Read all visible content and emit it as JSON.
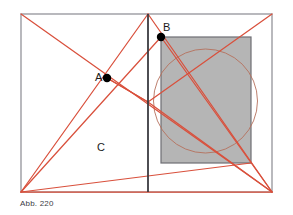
{
  "figure": {
    "caption": "Abb. 220",
    "colors": {
      "construction_line": "#d9503c",
      "frame_stroke": "#8a8a92",
      "axis_stroke": "#3a3a40",
      "shaded_rect_fill": "#b5b5b5",
      "shaded_rect_stroke": "#6e6e74",
      "circle_stroke": "#b5705c",
      "point_fill": "#000000",
      "label_color": "#1a1a1a",
      "caption_color": "#3c3c46",
      "background": "#ffffff"
    },
    "labels": [
      {
        "id": "A",
        "text": "A",
        "x": 95,
        "y": 81
      },
      {
        "id": "B",
        "text": "B",
        "x": 163,
        "y": 31
      },
      {
        "id": "C",
        "text": "C",
        "x": 97,
        "y": 151
      }
    ],
    "points": [
      {
        "id": "A",
        "cx": 107,
        "cy": 78,
        "r": 4.2
      },
      {
        "id": "B",
        "cx": 161,
        "cy": 37,
        "r": 4.2
      }
    ],
    "outer_frame": {
      "x": 21,
      "y": 14,
      "width": 251,
      "height": 178
    },
    "vertical_axis": {
      "x": 148,
      "y1": 14,
      "y2": 192
    },
    "shaded_rect": {
      "x": 161,
      "y": 37,
      "width": 90,
      "height": 126
    },
    "inscribed_circle": {
      "cx": 205.5,
      "cy": 101,
      "r": 52
    },
    "construction_lines": [
      {
        "id": "L1",
        "x1": 21,
        "y1": 14,
        "x2": 272,
        "y2": 192
      },
      {
        "id": "L2",
        "x1": 21,
        "y1": 192,
        "x2": 148,
        "y2": 14
      },
      {
        "id": "L3",
        "x1": 21,
        "y1": 192,
        "x2": 161,
        "y2": 37
      },
      {
        "id": "L4",
        "x1": 21,
        "y1": 192,
        "x2": 251,
        "y2": 163
      },
      {
        "id": "L5",
        "x1": 21,
        "y1": 192,
        "x2": 272,
        "y2": 192
      },
      {
        "id": "L6",
        "x1": 148,
        "y1": 14,
        "x2": 272,
        "y2": 192
      },
      {
        "id": "L7",
        "x1": 148,
        "y1": 102,
        "x2": 272,
        "y2": 14
      },
      {
        "id": "L8",
        "x1": 148,
        "y1": 102,
        "x2": 272,
        "y2": 192
      },
      {
        "id": "L9",
        "x1": 161,
        "y1": 37,
        "x2": 272,
        "y2": 192
      },
      {
        "id": "L10",
        "x1": 107,
        "y1": 78,
        "x2": 148,
        "y2": 102
      },
      {
        "id": "L11",
        "x1": 148,
        "y1": 102,
        "x2": 107,
        "y2": 78
      }
    ]
  }
}
